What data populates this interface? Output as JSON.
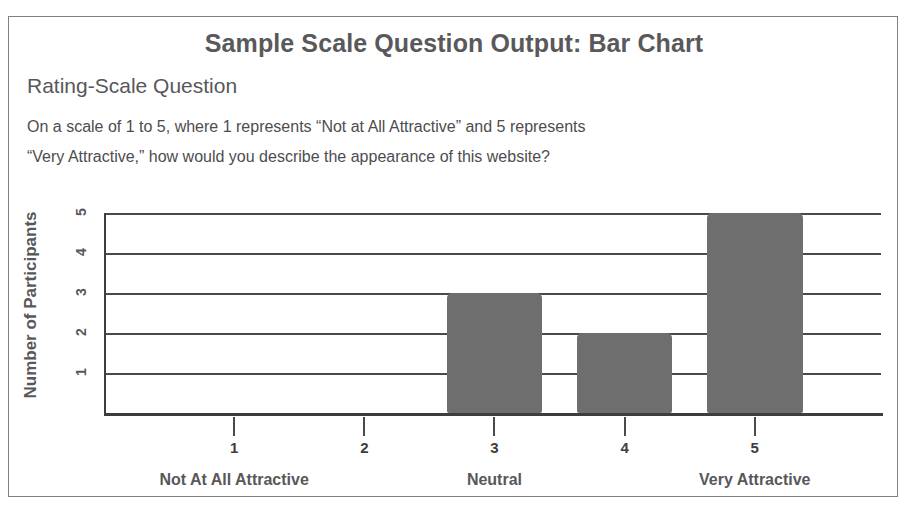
{
  "header": {
    "title": "Sample Scale Question Output: Bar Chart",
    "subtitle": "Rating-Scale Question",
    "question_line_1": "On a scale of 1 to 5, where 1 represents “Not at All Attractive” and 5 represents",
    "question_line_2": "“Very Attractive,” how would you describe the appearance of this website?"
  },
  "colors": {
    "bar": "#6e6e6e",
    "axis": "#3d3d3f",
    "grid": "#4a4a4c",
    "text": "#58585a",
    "frame": "#808080",
    "background": "#ffffff"
  },
  "chart_data": {
    "type": "bar",
    "title": "Sample Scale Question Output: Bar Chart",
    "xlabel": "",
    "ylabel": "Number of Participants",
    "categories": [
      "1",
      "2",
      "3",
      "4",
      "5"
    ],
    "values": [
      0,
      0,
      3,
      2,
      5
    ],
    "ylim": [
      0,
      5
    ],
    "yticks": [
      "1",
      "2",
      "3",
      "4",
      "5"
    ],
    "xticks": [
      "1",
      "2",
      "3",
      "4",
      "5"
    ],
    "grid": true,
    "legend": "none",
    "anchor_labels": [
      {
        "text": "Not At All Attractive",
        "at_tick": "1"
      },
      {
        "text": "Neutral",
        "at_tick": "3"
      },
      {
        "text": "Very Attractive",
        "at_tick": "5"
      }
    ]
  }
}
